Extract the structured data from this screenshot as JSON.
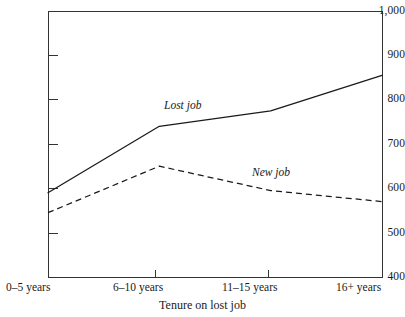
{
  "chart_data": {
    "type": "line",
    "title": "",
    "subtitle": "",
    "xlabel": "Tenure on lost job",
    "ylabel": "",
    "categories": [
      "0–5 years",
      "6–10 years",
      "11–15 years",
      "16+ years"
    ],
    "series": [
      {
        "name": "Lost job",
        "values": [
          590,
          740,
          775,
          855
        ],
        "style": "solid"
      },
      {
        "name": "New job",
        "values": [
          545,
          650,
          595,
          570
        ],
        "style": "dashed"
      }
    ],
    "ylim": [
      400,
      1000
    ],
    "yticks": [
      400,
      500,
      600,
      700,
      800,
      900,
      1000
    ],
    "ytick_labels": [
      "400",
      "500",
      "600",
      "700",
      "800",
      "900",
      "1,000"
    ],
    "grid": false,
    "legend": "inline-annotations",
    "annotations": [
      {
        "text": "Lost job",
        "series": "Lost job",
        "style": "italic"
      },
      {
        "text": "New job",
        "series": "New job",
        "style": "italic"
      }
    ]
  },
  "axes": {
    "y": {
      "labels": {
        "t1000": "1,000",
        "t900": "900",
        "t800": "800",
        "t700": "700",
        "t600": "600",
        "t500": "500",
        "t400": "400"
      }
    },
    "x": {
      "title": "Tenure on lost job",
      "labels": {
        "c0": "0–5 years",
        "c1": "6–10 years",
        "c2": "11–15 years",
        "c3": "16+ years"
      }
    }
  },
  "series_labels": {
    "lost_job": "Lost job",
    "new_job": "New job"
  },
  "colors": {
    "line": "#1a1a1a",
    "axis": "#333333",
    "background": "#ffffff"
  }
}
